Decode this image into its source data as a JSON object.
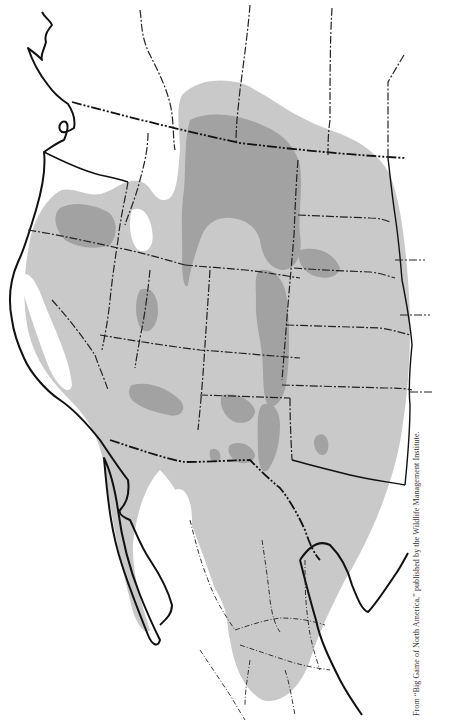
{
  "map": {
    "type": "species-range-map",
    "region": "Western North America",
    "shading": {
      "light": "#c9c9c9",
      "dark": "#a2a2a2",
      "background": "#ffffff",
      "border": "#111111"
    },
    "legend": null
  },
  "caption": {
    "text": "From “Big Game of North America,” published by the Wildlife Management Institute."
  }
}
